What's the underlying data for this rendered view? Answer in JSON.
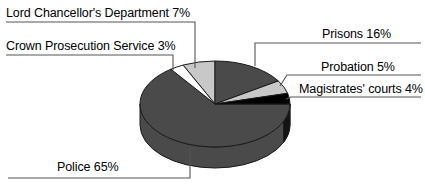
{
  "chart_data": {
    "type": "pie",
    "title": "",
    "subtitle": "",
    "xlabel": "",
    "ylabel": "",
    "legend_position": "callout-labels",
    "grid": false,
    "three_d": true,
    "start_angle_deg": 0,
    "direction": "clockwise",
    "categories": [
      "Prisons",
      "Probation",
      "Magistrates' courts",
      "Police",
      "Crown Prosecution Service",
      "Lord Chancellor's Department"
    ],
    "values": [
      16,
      5,
      4,
      65,
      3,
      7
    ],
    "unit": "%",
    "slices": [
      {
        "name": "Prisons",
        "value": 16,
        "label": "Prisons 16%",
        "color": "#4a4a4a",
        "start_pct": 0,
        "end_pct": 16
      },
      {
        "name": "Probation",
        "value": 5,
        "label": "Probation 5%",
        "color": "#c8c8c8",
        "start_pct": 16,
        "end_pct": 21
      },
      {
        "name": "Magistrates' courts",
        "value": 4,
        "label": "Magistrates' courts 4%",
        "color": "#000000",
        "start_pct": 21,
        "end_pct": 25
      },
      {
        "name": "Police",
        "value": 65,
        "label": "Police 65%",
        "color": "#4a4a4a",
        "start_pct": 25,
        "end_pct": 90
      },
      {
        "name": "Crown Prosecution Service",
        "value": 3,
        "label": "Crown Prosecution Service 3%",
        "color": "#ffffff",
        "start_pct": 90,
        "end_pct": 93
      },
      {
        "name": "Lord Chancellor's Department",
        "value": 7,
        "label": "Lord Chancellor's Department 7%",
        "color": "#c8c8c8",
        "start_pct": 93,
        "end_pct": 100
      }
    ]
  },
  "labels": {
    "lord_chancellors_department": "Lord Chancellor's Department 7%",
    "crown_prosecution_service": "Crown Prosecution Service 3%",
    "prisons": "Prisons 16%",
    "probation": "Probation 5%",
    "magistrates_courts": "Magistrates' courts 4%",
    "police": "Police 65%"
  },
  "colors": {
    "background": "#ffffff",
    "outline": "#000000",
    "leader_line": "#555555",
    "dark_gray": "#4a4a4a",
    "light_gray": "#c8c8c8",
    "black": "#000000",
    "white": "#ffffff"
  }
}
